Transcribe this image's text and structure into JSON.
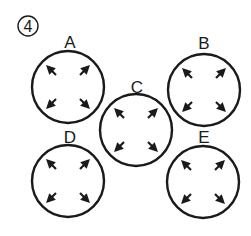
{
  "badge": {
    "number": "4"
  },
  "stroke_color": "#1a1a1a",
  "arrow_color": "#1a1a1a",
  "circles": [
    {
      "id": "A",
      "label": "A",
      "cx": 68,
      "cy": 87,
      "r": 36,
      "arrow_direction": "outward"
    },
    {
      "id": "B",
      "label": "B",
      "cx": 204,
      "cy": 90,
      "r": 36,
      "arrow_direction": "outward"
    },
    {
      "id": "C",
      "label": "C",
      "cx": 136,
      "cy": 130,
      "r": 36,
      "arrow_direction": "outward"
    },
    {
      "id": "D",
      "label": "D",
      "cx": 68,
      "cy": 181,
      "r": 36,
      "arrow_direction": "outward"
    },
    {
      "id": "E",
      "label": "E",
      "cx": 203,
      "cy": 182,
      "r": 36,
      "arrow_direction": "outward"
    }
  ]
}
